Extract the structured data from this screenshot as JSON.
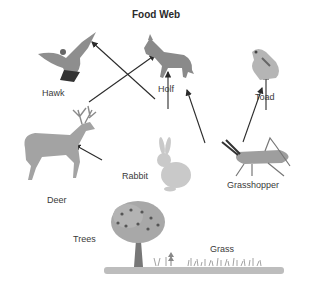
{
  "title": "Food Web",
  "organisms": {
    "hawk": {
      "label": "Hawk"
    },
    "wolf": {
      "label": "Holf"
    },
    "toad": {
      "label": "Toad"
    },
    "deer": {
      "label": "Deer"
    },
    "rabbit": {
      "label": "Rabbit"
    },
    "grasshopper": {
      "label": "Grasshopper"
    },
    "trees": {
      "label": "Trees"
    },
    "grass": {
      "label": "Grass"
    }
  },
  "arrows": [
    {
      "from": "Trees",
      "to": "Deer"
    },
    {
      "from": "Grass",
      "to": "Rabbit"
    },
    {
      "from": "Grass",
      "to": "Grasshopper"
    },
    {
      "from": "Deer",
      "to": "Holf"
    },
    {
      "from": "Rabbit",
      "to": "Hawk"
    },
    {
      "from": "Rabbit",
      "to": "Holf"
    },
    {
      "from": "Grasshopper",
      "to": "Toad"
    }
  ],
  "colors": {
    "arrow": "#2b2b2b",
    "ground": "#b9b9b9",
    "animal": "#9a9a9a"
  }
}
